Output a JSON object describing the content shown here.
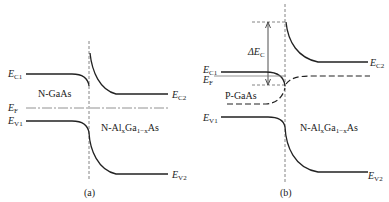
{
  "figure_a": {
    "caption": "(a)",
    "labels": {
      "ec1": {
        "main": "E",
        "sub": "C1"
      },
      "ec2": {
        "main": "E",
        "sub": "C2"
      },
      "ef": {
        "main": "E",
        "sub": "F"
      },
      "ev1": {
        "main": "E",
        "sub": "V1"
      },
      "ev2": {
        "main": "E",
        "sub": "V2"
      },
      "left_region": "N-GaAs",
      "right_region": {
        "p1": "N-Al",
        "s1": "x",
        "p2": "Ga",
        "s2": "1−x",
        "p3": "As"
      }
    }
  },
  "figure_b": {
    "caption": "(b)",
    "labels": {
      "ec1": {
        "main": "E",
        "sub": "C1"
      },
      "ec2": {
        "main": "E",
        "sub": "C2"
      },
      "ef": {
        "main": "E",
        "sub": "F"
      },
      "ev1": {
        "main": "E",
        "sub": "V1"
      },
      "ev2": {
        "main": "E",
        "sub": "V2"
      },
      "delta_ec": {
        "main": "ΔE",
        "sub": "C"
      },
      "left_region": "P-GaAs",
      "right_region": {
        "p1": "N-Al",
        "s1": "x",
        "p2": "Ga",
        "s2": "1−x",
        "p3": "As"
      }
    }
  },
  "colors": {
    "line": "#222222",
    "dashed": "#555555",
    "background": "#ffffff"
  }
}
